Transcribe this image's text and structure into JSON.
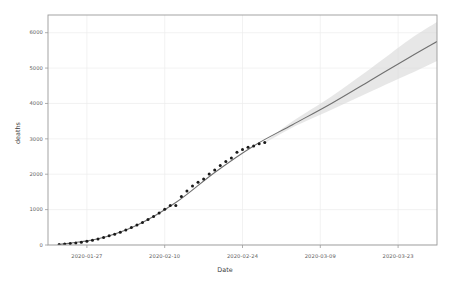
{
  "axes": {
    "x_title": "Date",
    "y_title": "deaths",
    "x_ticks": [
      "2020-01-27",
      "2020-02-10",
      "2020-02-24",
      "2020-03-09",
      "2020-03-23"
    ],
    "y_ticks": [
      "0",
      "1000",
      "2000",
      "3000",
      "4000",
      "5000",
      "6000"
    ]
  },
  "style": {
    "point_color": "#1a1a1a",
    "line_color": "#707070",
    "band_color": "#d9d9d9",
    "grid_color": "#ededed",
    "border_color": "#9a9a9a",
    "background": "#ffffff"
  },
  "chart_data": {
    "type": "scatter",
    "title": "",
    "xlabel": "Date",
    "ylabel": "deaths",
    "xlim": [
      "2020-01-20",
      "2020-03-30"
    ],
    "ylim": [
      0,
      6500
    ],
    "grid": true,
    "legend": "none",
    "x_tick_values": [
      "2020-01-27",
      "2020-02-10",
      "2020-02-24",
      "2020-03-09",
      "2020-03-23"
    ],
    "y_tick_values": [
      0,
      1000,
      2000,
      3000,
      4000,
      5000,
      6000
    ],
    "series": [
      {
        "name": "observed deaths",
        "type": "scatter",
        "marker": "filled-circle",
        "x": [
          "2020-01-22",
          "2020-01-23",
          "2020-01-24",
          "2020-01-25",
          "2020-01-26",
          "2020-01-27",
          "2020-01-28",
          "2020-01-29",
          "2020-01-30",
          "2020-01-31",
          "2020-02-01",
          "2020-02-02",
          "2020-02-03",
          "2020-02-04",
          "2020-02-05",
          "2020-02-06",
          "2020-02-07",
          "2020-02-08",
          "2020-02-09",
          "2020-02-10",
          "2020-02-11",
          "2020-02-12",
          "2020-02-13",
          "2020-02-14",
          "2020-02-15",
          "2020-02-16",
          "2020-02-17",
          "2020-02-18",
          "2020-02-19",
          "2020-02-20",
          "2020-02-21",
          "2020-02-22",
          "2020-02-23",
          "2020-02-24",
          "2020-02-25",
          "2020-02-26",
          "2020-02-27",
          "2020-02-28"
        ],
        "y": [
          17,
          25,
          41,
          56,
          80,
          106,
          132,
          170,
          213,
          259,
          304,
          362,
          426,
          492,
          564,
          634,
          719,
          806,
          906,
          1013,
          1113,
          1118,
          1371,
          1523,
          1666,
          1770,
          1868,
          2007,
          2122,
          2247,
          2360,
          2460,
          2618,
          2699,
          2763,
          2800,
          2858,
          2900
        ]
      },
      {
        "name": "fitted / forecast curve",
        "type": "line",
        "x": [
          "2020-01-22",
          "2020-01-29",
          "2020-02-05",
          "2020-02-12",
          "2020-02-19",
          "2020-02-26",
          "2020-03-04",
          "2020-03-11",
          "2020-03-18",
          "2020-03-25",
          "2020-03-30"
        ],
        "y": [
          15,
          175,
          560,
          1200,
          2050,
          2800,
          3400,
          4000,
          4650,
          5300,
          5750
        ]
      },
      {
        "name": "confidence band upper",
        "type": "line",
        "x": [
          "2020-02-28",
          "2020-03-04",
          "2020-03-11",
          "2020-03-18",
          "2020-03-25",
          "2020-03-30"
        ],
        "y": [
          2920,
          3500,
          4200,
          4980,
          5800,
          6300
        ]
      },
      {
        "name": "confidence band lower",
        "type": "line",
        "x": [
          "2020-02-28",
          "2020-03-04",
          "2020-03-11",
          "2020-03-18",
          "2020-03-25",
          "2020-03-30"
        ],
        "y": [
          2880,
          3320,
          3820,
          4330,
          4830,
          5200
        ]
      }
    ]
  }
}
